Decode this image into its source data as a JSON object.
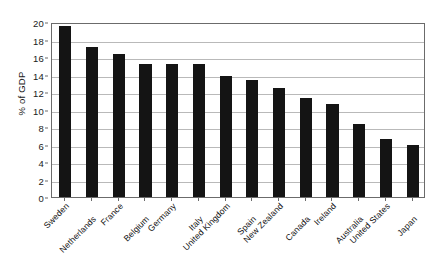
{
  "chart_data": {
    "type": "bar",
    "title": "",
    "xlabel": "",
    "ylabel": "% of GDP",
    "ylim": [
      0,
      20
    ],
    "ytick_step": 2,
    "yticks": [
      "0",
      "2",
      "4",
      "6",
      "8",
      "10",
      "12",
      "14",
      "16",
      "18",
      "20"
    ],
    "grid": true,
    "legend": "none",
    "bar_color": "#141414",
    "categories": [
      "Sweden",
      "Netherlands",
      "France",
      "Belgium",
      "Germany",
      "Italy",
      "United Kingdom",
      "Spain",
      "New Zealand",
      "Canada",
      "Ireland",
      "Australia",
      "United States",
      "Japan"
    ],
    "values": [
      19.5,
      17.2,
      16.3,
      15.2,
      15.2,
      15.2,
      13.8,
      13.4,
      12.5,
      11.3,
      10.6,
      8.4,
      6.6,
      6.0
    ]
  }
}
